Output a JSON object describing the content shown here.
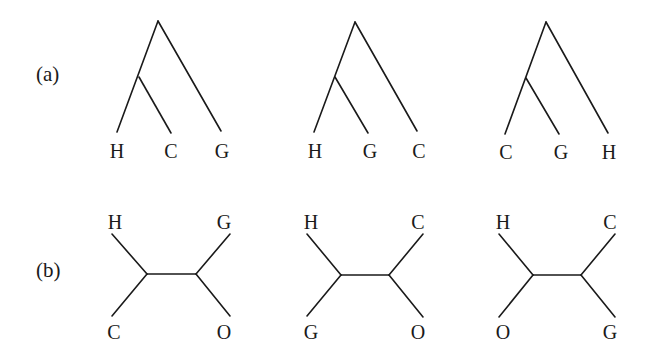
{
  "figure": {
    "panels": [
      {
        "label": "(a)",
        "kind": "rooted",
        "trees": [
          {
            "leaves": [
              "H",
              "C",
              "G"
            ]
          },
          {
            "leaves": [
              "H",
              "G",
              "C"
            ]
          },
          {
            "leaves": [
              "C",
              "G",
              "H"
            ]
          }
        ]
      },
      {
        "label": "(b)",
        "kind": "unrooted",
        "trees": [
          {
            "top_left": "H",
            "top_right": "G",
            "bottom_left": "C",
            "bottom_right": "O"
          },
          {
            "top_left": "H",
            "top_right": "C",
            "bottom_left": "G",
            "bottom_right": "O"
          },
          {
            "top_left": "H",
            "top_right": "C",
            "bottom_left": "O",
            "bottom_right": "G"
          }
        ]
      }
    ]
  }
}
